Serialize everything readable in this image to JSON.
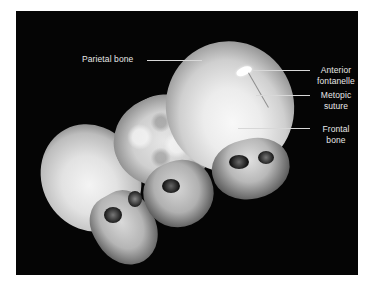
{
  "figure": {
    "background_color": "#050505",
    "label_color": "#e8e8e8"
  },
  "labels": {
    "parietal_bone": "Parietal bone",
    "anterior_fontanelle_line1": "Anterior",
    "anterior_fontanelle_line2": "fontanelle",
    "metopic_suture_line1": "Metopic",
    "metopic_suture_line2": "suture",
    "frontal_bone_line1": "Frontal",
    "frontal_bone_line2": "bone"
  },
  "skulls": [
    {
      "position": "left",
      "surface": "smooth"
    },
    {
      "position": "middle",
      "surface": "bumpy"
    },
    {
      "position": "right",
      "surface": "smooth",
      "annotated": true
    }
  ]
}
